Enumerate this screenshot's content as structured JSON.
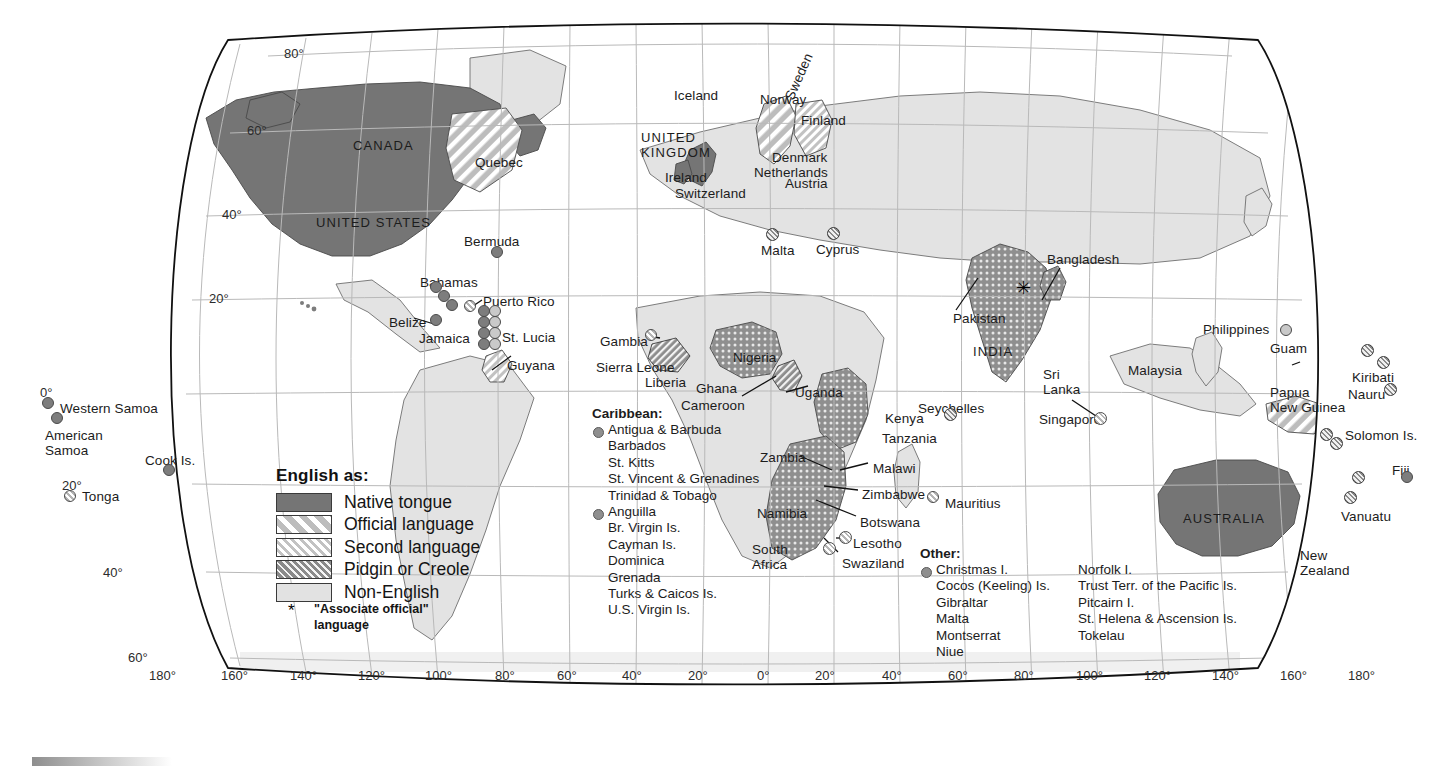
{
  "legend": {
    "title": "English as:",
    "items": [
      {
        "label": "Native tongue",
        "pattern": "solid-dark",
        "color": "#757575"
      },
      {
        "label": "Official language",
        "pattern": "diag-wide",
        "color": "#bcbcbc"
      },
      {
        "label": "Second language",
        "pattern": "diag-narrow",
        "color": "#c9c9c9"
      },
      {
        "label": "Pidgin or Creole",
        "pattern": "diag-dense",
        "color": "#9a9a9a"
      },
      {
        "label": "Non-English",
        "pattern": "plain-light",
        "color": "#e2e2e2"
      }
    ],
    "footnote_symbol": "*",
    "footnote_text": "\"Associate official\"\nlanguage"
  },
  "caribbean_list": {
    "heading": "Caribbean:",
    "group1": [
      "Antigua & Barbuda",
      "Barbados",
      "St. Kitts",
      "St. Vincent & Grenadines",
      "Trinidad & Tobago"
    ],
    "group2": [
      "Anguilla",
      "Br. Virgin Is.",
      "Cayman Is.",
      "Dominica",
      "Grenada",
      "Turks & Caicos Is.",
      "U.S. Virgin Is."
    ]
  },
  "other_list": {
    "heading": "Other:",
    "column1": [
      "Christmas I.",
      "Cocos (Keeling) Is.",
      "Gibraltar",
      "Malta",
      "Montserrat",
      "Niue"
    ],
    "column2": [
      "Norfolk I.",
      "Trust Terr. of the Pacific Is.",
      "Pitcairn I.",
      "St. Helena  & Ascension Is.",
      "Tokelau"
    ]
  },
  "latitude_labels": [
    "80°",
    "60°",
    "40°",
    "20°",
    "0°",
    "20°",
    "40°",
    "60°"
  ],
  "longitude_labels": [
    "180°",
    "160°",
    "140°",
    "120°",
    "100°",
    "80°",
    "60°",
    "40°",
    "20°",
    "0°",
    "20°",
    "40°",
    "60°",
    "80°",
    "100°",
    "120°",
    "140°",
    "160°",
    "180°"
  ],
  "map_labels": [
    {
      "id": "canada",
      "text": "CANADA",
      "x": 353,
      "y": 139,
      "style": "caps"
    },
    {
      "id": "united-states",
      "text": "UNITED STATES",
      "x": 316,
      "y": 216,
      "style": "caps"
    },
    {
      "id": "quebec",
      "text": "Quebec",
      "x": 475,
      "y": 155,
      "style": ""
    },
    {
      "id": "bermuda",
      "text": "Bermuda",
      "x": 464,
      "y": 234,
      "style": ""
    },
    {
      "id": "bahamas",
      "text": "Bahamas",
      "x": 420,
      "y": 275,
      "style": ""
    },
    {
      "id": "puerto-rico",
      "text": "Puerto Rico",
      "x": 483,
      "y": 294,
      "style": ""
    },
    {
      "id": "belize",
      "text": "Belize",
      "x": 389,
      "y": 315,
      "style": ""
    },
    {
      "id": "jamaica",
      "text": "Jamaica",
      "x": 419,
      "y": 331,
      "style": ""
    },
    {
      "id": "st-lucia",
      "text": "St. Lucia",
      "x": 502,
      "y": 330,
      "style": ""
    },
    {
      "id": "guyana",
      "text": "Guyana",
      "x": 507,
      "y": 358,
      "style": ""
    },
    {
      "id": "western-samoa",
      "text": "Western Samoa",
      "x": 60,
      "y": 401,
      "style": ""
    },
    {
      "id": "american-samoa",
      "text": "American\nSamoa",
      "x": 45,
      "y": 428,
      "style": "two"
    },
    {
      "id": "cook-is",
      "text": "Cook Is.",
      "x": 145,
      "y": 453,
      "style": ""
    },
    {
      "id": "tonga",
      "text": "Tonga",
      "x": 82,
      "y": 489,
      "style": ""
    },
    {
      "id": "iceland",
      "text": "Iceland",
      "x": 674,
      "y": 88,
      "style": ""
    },
    {
      "id": "norway",
      "text": "Norway",
      "x": 760,
      "y": 92,
      "style": ""
    },
    {
      "id": "sweden",
      "text": "Sweden",
      "x": 782,
      "y": 96,
      "style": "rot"
    },
    {
      "id": "finland",
      "text": "Finland",
      "x": 801,
      "y": 113,
      "style": ""
    },
    {
      "id": "united-kingdom",
      "text": "UNITED\nKINGDOM",
      "x": 641,
      "y": 131,
      "style": "two caps"
    },
    {
      "id": "denmark",
      "text": "Denmark",
      "x": 772,
      "y": 150,
      "style": ""
    },
    {
      "id": "netherlands",
      "text": "Netherlands",
      "x": 754,
      "y": 165,
      "style": ""
    },
    {
      "id": "ireland",
      "text": "Ireland",
      "x": 665,
      "y": 170,
      "style": ""
    },
    {
      "id": "austria",
      "text": "Austria",
      "x": 785,
      "y": 176,
      "style": ""
    },
    {
      "id": "switzerland",
      "text": "Switzerland",
      "x": 675,
      "y": 186,
      "style": ""
    },
    {
      "id": "malta",
      "text": "Malta",
      "x": 761,
      "y": 243,
      "style": ""
    },
    {
      "id": "cyprus",
      "text": "Cyprus",
      "x": 816,
      "y": 242,
      "style": ""
    },
    {
      "id": "gambia",
      "text": "Gambia",
      "x": 600,
      "y": 334,
      "style": ""
    },
    {
      "id": "sierra-leone",
      "text": "Sierra Leone",
      "x": 596,
      "y": 360,
      "style": ""
    },
    {
      "id": "liberia",
      "text": "Liberia",
      "x": 645,
      "y": 375,
      "style": ""
    },
    {
      "id": "ghana",
      "text": "Ghana",
      "x": 696,
      "y": 381,
      "style": ""
    },
    {
      "id": "cameroon",
      "text": "Cameroon",
      "x": 681,
      "y": 398,
      "style": ""
    },
    {
      "id": "nigeria",
      "text": "Nigeria",
      "x": 733,
      "y": 350,
      "style": ""
    },
    {
      "id": "uganda",
      "text": "Uganda",
      "x": 795,
      "y": 385,
      "style": ""
    },
    {
      "id": "kenya",
      "text": "Kenya",
      "x": 885,
      "y": 411,
      "style": ""
    },
    {
      "id": "tanzania",
      "text": "Tanzania",
      "x": 882,
      "y": 431,
      "style": ""
    },
    {
      "id": "seychelles",
      "text": "Seychelles",
      "x": 918,
      "y": 401,
      "style": ""
    },
    {
      "id": "zambia",
      "text": "Zambia",
      "x": 760,
      "y": 450,
      "style": ""
    },
    {
      "id": "malawi",
      "text": "Malawi",
      "x": 873,
      "y": 461,
      "style": ""
    },
    {
      "id": "zimbabwe",
      "text": "Zimbabwe",
      "x": 862,
      "y": 487,
      "style": ""
    },
    {
      "id": "botswana",
      "text": "Botswana",
      "x": 860,
      "y": 515,
      "style": ""
    },
    {
      "id": "mauritius",
      "text": "Mauritius",
      "x": 945,
      "y": 496,
      "style": ""
    },
    {
      "id": "namibia",
      "text": "Namibia",
      "x": 757,
      "y": 506,
      "style": ""
    },
    {
      "id": "lesotho",
      "text": "Lesotho",
      "x": 853,
      "y": 536,
      "style": ""
    },
    {
      "id": "south-africa",
      "text": "South\nAfrica",
      "x": 752,
      "y": 542,
      "style": "two"
    },
    {
      "id": "swaziland",
      "text": "Swaziland",
      "x": 842,
      "y": 556,
      "style": ""
    },
    {
      "id": "pakistan",
      "text": "Pakistan",
      "x": 953,
      "y": 311,
      "style": ""
    },
    {
      "id": "india",
      "text": "INDIA",
      "x": 973,
      "y": 345,
      "style": "caps"
    },
    {
      "id": "bangladesh",
      "text": "Bangladesh",
      "x": 1047,
      "y": 252,
      "style": ""
    },
    {
      "id": "sri-lanka",
      "text": "Sri\nLanka",
      "x": 1043,
      "y": 367,
      "style": "two"
    },
    {
      "id": "malaysia",
      "text": "Malaysia",
      "x": 1128,
      "y": 363,
      "style": ""
    },
    {
      "id": "singapore",
      "text": "Singapore",
      "x": 1039,
      "y": 412,
      "style": ""
    },
    {
      "id": "philippines",
      "text": "Philippines",
      "x": 1203,
      "y": 322,
      "style": ""
    },
    {
      "id": "guam",
      "text": "Guam",
      "x": 1270,
      "y": 341,
      "style": ""
    },
    {
      "id": "kiribati",
      "text": "Kiribati",
      "x": 1352,
      "y": 370,
      "style": ""
    },
    {
      "id": "nauru",
      "text": "Nauru",
      "x": 1348,
      "y": 387,
      "style": ""
    },
    {
      "id": "papua-new-guinea",
      "text": "Papua\nNew Guinea",
      "x": 1270,
      "y": 385,
      "style": "two"
    },
    {
      "id": "solomon-is",
      "text": "Solomon Is.",
      "x": 1345,
      "y": 428,
      "style": ""
    },
    {
      "id": "fiji",
      "text": "Fiji",
      "x": 1392,
      "y": 463,
      "style": ""
    },
    {
      "id": "vanuatu",
      "text": "Vanuatu",
      "x": 1341,
      "y": 509,
      "style": ""
    },
    {
      "id": "australia",
      "text": "AUSTRALIA",
      "x": 1183,
      "y": 512,
      "style": "caps"
    },
    {
      "id": "new-zealand",
      "text": "New\nZealand",
      "x": 1300,
      "y": 548,
      "style": "two"
    }
  ],
  "map_points": [
    {
      "id": "bermuda-pt",
      "x": 497,
      "y": 252,
      "r": 6,
      "cls": "native"
    },
    {
      "id": "bahamas-pt-1",
      "x": 436,
      "y": 287,
      "r": 6,
      "cls": "native"
    },
    {
      "id": "bahamas-pt-2",
      "x": 444,
      "y": 296,
      "r": 6,
      "cls": "native"
    },
    {
      "id": "bahamas-pt-3",
      "x": 452,
      "y": 305,
      "r": 6,
      "cls": "native"
    },
    {
      "id": "puerto-rico-pt",
      "x": 470,
      "y": 306,
      "r": 6,
      "cls": "second"
    },
    {
      "id": "jamaica-pt",
      "x": 436,
      "y": 320,
      "r": 6,
      "cls": "native"
    },
    {
      "id": "carib-pt-1",
      "x": 484,
      "y": 311,
      "r": 6,
      "cls": "native"
    },
    {
      "id": "carib-pt-2",
      "x": 495,
      "y": 311,
      "r": 6,
      "cls": "official"
    },
    {
      "id": "carib-pt-3",
      "x": 484,
      "y": 322,
      "r": 6,
      "cls": "native"
    },
    {
      "id": "carib-pt-4",
      "x": 495,
      "y": 322,
      "r": 6,
      "cls": "official"
    },
    {
      "id": "carib-pt-5",
      "x": 484,
      "y": 333,
      "r": 6,
      "cls": "native"
    },
    {
      "id": "carib-pt-6",
      "x": 495,
      "y": 333,
      "r": 6,
      "cls": "official"
    },
    {
      "id": "carib-pt-7",
      "x": 484,
      "y": 344,
      "r": 6,
      "cls": "native"
    },
    {
      "id": "carib-pt-8",
      "x": 495,
      "y": 344,
      "r": 6,
      "cls": "official"
    },
    {
      "id": "western-samoa-pt",
      "x": 48,
      "y": 403,
      "r": 6,
      "cls": "native"
    },
    {
      "id": "american-samoa-pt",
      "x": 57,
      "y": 418,
      "r": 6,
      "cls": "native"
    },
    {
      "id": "cook-is-pt",
      "x": 169,
      "y": 470,
      "r": 6,
      "cls": "native"
    },
    {
      "id": "tonga-pt",
      "x": 70,
      "y": 496,
      "r": 6,
      "cls": "second"
    },
    {
      "id": "malta-pt",
      "x": 772,
      "y": 234,
      "r": 6.5,
      "cls": "pidgin"
    },
    {
      "id": "cyprus-pt",
      "x": 833,
      "y": 233,
      "r": 6.5,
      "cls": "pidgin"
    },
    {
      "id": "gambia-pt",
      "x": 651,
      "y": 335,
      "r": 6,
      "cls": "second"
    },
    {
      "id": "seychelles-pt",
      "x": 950,
      "y": 414,
      "r": 6.5,
      "cls": "pidgin"
    },
    {
      "id": "mauritius-pt",
      "x": 933,
      "y": 497,
      "r": 6,
      "cls": "second"
    },
    {
      "id": "lesotho-pt",
      "x": 845,
      "y": 537,
      "r": 6.5,
      "cls": "second"
    },
    {
      "id": "swaziland-pt",
      "x": 829,
      "y": 548,
      "r": 6.5,
      "cls": "second"
    },
    {
      "id": "singapore-pt",
      "x": 1100,
      "y": 418,
      "r": 6.5,
      "cls": "second"
    },
    {
      "id": "guam-pt",
      "x": 1286,
      "y": 330,
      "r": 6,
      "cls": "official"
    },
    {
      "id": "kiribati-pt-1",
      "x": 1367,
      "y": 350,
      "r": 6.5,
      "cls": "pidgin"
    },
    {
      "id": "kiribati-pt-2",
      "x": 1383,
      "y": 362,
      "r": 6.5,
      "cls": "pidgin"
    },
    {
      "id": "nauru-pt",
      "x": 1390,
      "y": 389,
      "r": 6.5,
      "cls": "pidgin"
    },
    {
      "id": "solomon-pt-1",
      "x": 1326,
      "y": 434,
      "r": 6.5,
      "cls": "pidgin"
    },
    {
      "id": "solomon-pt-2",
      "x": 1336,
      "y": 443,
      "r": 6.5,
      "cls": "pidgin"
    },
    {
      "id": "fiji-pt",
      "x": 1407,
      "y": 477,
      "r": 6,
      "cls": "native"
    },
    {
      "id": "fiji-pt-2",
      "x": 1358,
      "y": 477,
      "r": 6.5,
      "cls": "pidgin"
    },
    {
      "id": "vanuatu-pt",
      "x": 1350,
      "y": 497,
      "r": 6.5,
      "cls": "pidgin"
    }
  ]
}
